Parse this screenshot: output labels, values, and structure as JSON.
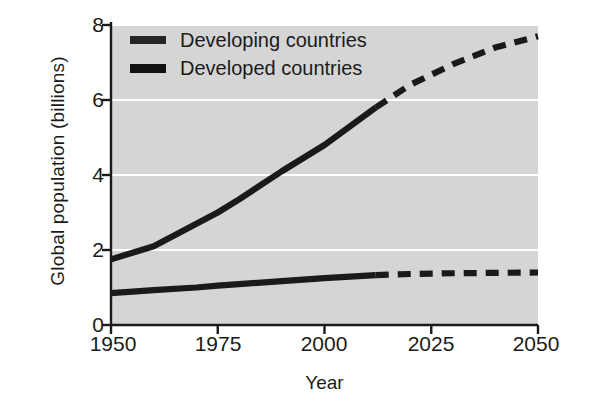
{
  "chart_data": {
    "type": "line",
    "title": "",
    "xlabel": "Year",
    "ylabel": "Global population (billions)",
    "xlim": [
      1950,
      2050
    ],
    "ylim": [
      0,
      8
    ],
    "xticks": [
      "1950",
      "1975",
      "2000",
      "2025",
      "2050"
    ],
    "yticks": [
      "0",
      "2",
      "4",
      "6",
      "8"
    ],
    "grid": "horizontal-white-gridlines",
    "legend_position": "top-left-inside",
    "projection_start_year": 2012,
    "series": [
      {
        "name": "Developing countries",
        "style": "solid-then-dashed",
        "x": [
          1950,
          1960,
          1970,
          1975,
          1980,
          1990,
          2000,
          2012,
          2020,
          2030,
          2040,
          2050
        ],
        "values": [
          1.75,
          2.1,
          2.7,
          3.0,
          3.35,
          4.1,
          4.8,
          5.8,
          6.4,
          6.95,
          7.4,
          7.7
        ]
      },
      {
        "name": "Developed countries",
        "style": "solid-then-dashed",
        "x": [
          1950,
          1960,
          1970,
          1975,
          1980,
          1990,
          2000,
          2012,
          2020,
          2030,
          2040,
          2050
        ],
        "values": [
          0.85,
          0.93,
          1.0,
          1.05,
          1.09,
          1.17,
          1.25,
          1.33,
          1.36,
          1.38,
          1.39,
          1.4
        ]
      }
    ],
    "colors": {
      "plot_background": "#d5d5d5",
      "gridline": "#ffffff",
      "line": "#1a1a1a",
      "axis": "#1a1a1a",
      "page_background": "#ffffff"
    }
  },
  "legend": {
    "items": [
      {
        "label": "Developing countries"
      },
      {
        "label": "Developed countries"
      }
    ]
  }
}
